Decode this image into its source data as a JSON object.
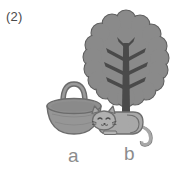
{
  "question": {
    "number": "(2)"
  },
  "illustration": {
    "objects": [
      {
        "name": "tree",
        "icon": "tree-icon"
      },
      {
        "name": "basket",
        "icon": "basket-icon"
      },
      {
        "name": "cat",
        "icon": "cat-icon"
      }
    ]
  },
  "labels": {
    "a": "a",
    "b": "b"
  },
  "colors": {
    "background": "#ffffff",
    "canopy_fill": "#8a8a8a",
    "canopy_stroke": "#5f5f5f",
    "trunk_fill": "#4a4a4a",
    "basket_fill": "#969696",
    "basket_rim": "#8a8a8a",
    "basket_stroke": "#6b6b6b",
    "cat_fill": "#a8a8a8",
    "cat_stroke": "#6e6e6e",
    "label_text": "#8c8c8c",
    "number_text": "#4a4a4a"
  }
}
